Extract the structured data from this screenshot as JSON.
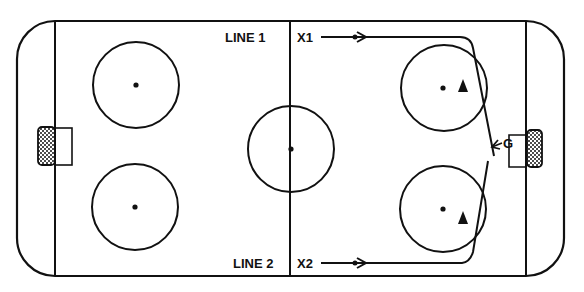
{
  "diagram": {
    "type": "hockey-rink-drill",
    "colors": {
      "ink": "#111111",
      "background": "#ffffff"
    },
    "labels": {
      "line1": "LINE 1",
      "line2": "LINE 2",
      "player1": "X1",
      "player2": "X2",
      "goalie": "G"
    },
    "rink": {
      "x": 17,
      "y": 21,
      "width": 547,
      "height": 255,
      "corner_radius": 38
    },
    "goal_lines_x": [
      55,
      526
    ],
    "center_line_x": 290,
    "faceoff_circles": [
      {
        "name": "left-top",
        "cx": 136,
        "cy": 85,
        "r": 43
      },
      {
        "name": "left-bottom",
        "cx": 135,
        "cy": 207,
        "r": 43
      },
      {
        "name": "center",
        "cx": 291,
        "cy": 149,
        "r": 43
      },
      {
        "name": "right-top",
        "cx": 444,
        "cy": 88,
        "r": 43
      },
      {
        "name": "right-bottom",
        "cx": 443,
        "cy": 209,
        "r": 43
      }
    ],
    "cones": [
      {
        "name": "cone-top",
        "x": 463,
        "y": 87
      },
      {
        "name": "cone-bottom",
        "x": 463,
        "y": 218
      }
    ]
  }
}
